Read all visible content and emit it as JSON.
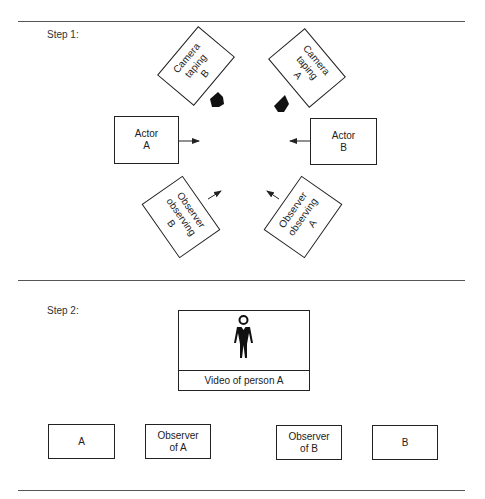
{
  "step1": {
    "label": "Step 1:",
    "camera_b": {
      "text": "Camera\ntaping\nB"
    },
    "camera_a": {
      "text": "Camera\ntaping\nA"
    },
    "actor_a": {
      "text": "Actor\nA"
    },
    "actor_b": {
      "text": "Actor\nB"
    },
    "observer_b": {
      "text": "Observer\nobserving\nB"
    },
    "observer_a": {
      "text": "Observer\nobserving\nA"
    }
  },
  "step2": {
    "label": "Step 2:",
    "video": {
      "caption": "Video of person A",
      "icon": "person-figure-icon"
    },
    "boxes": [
      {
        "text": "A"
      },
      {
        "text": "Observer\nof A"
      },
      {
        "text": "Observer\nof B"
      },
      {
        "text": "B"
      }
    ]
  },
  "colors": {
    "stroke": "#222222",
    "rule": "#555555",
    "background": "#ffffff"
  }
}
